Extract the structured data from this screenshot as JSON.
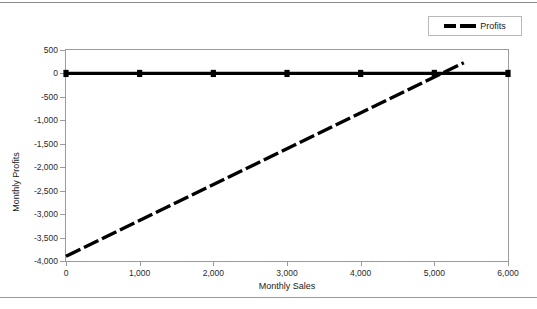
{
  "legend": {
    "position": "top-right",
    "entries": [
      {
        "label": "Profits",
        "style": "dashed",
        "color": "#000000"
      }
    ]
  },
  "chart_data": {
    "type": "line",
    "title": "",
    "xlabel": "Monthly Sales",
    "ylabel": "Monthly Profits",
    "xlim": [
      0,
      6000
    ],
    "ylim": [
      -4000,
      500
    ],
    "xticks": [
      "0",
      "1,000",
      "2,000",
      "3,000",
      "4,000",
      "5,000",
      "6,000"
    ],
    "xtick_values": [
      0,
      1000,
      2000,
      3000,
      4000,
      5000,
      6000
    ],
    "yticks": [
      "500",
      "0",
      "-500",
      "-1,000",
      "-1,500",
      "-2,000",
      "-2,500",
      "-3,000",
      "-3,500",
      "-4,000"
    ],
    "ytick_values": [
      500,
      0,
      -500,
      -1000,
      -1500,
      -2000,
      -2500,
      -3000,
      -3500,
      -4000
    ],
    "grid": false,
    "series": [
      {
        "name": "Zero Line",
        "style": "solid",
        "color": "#000000",
        "marker": "square",
        "x": [
          0,
          1000,
          2000,
          3000,
          4000,
          5000,
          6000
        ],
        "values": [
          0,
          0,
          0,
          0,
          0,
          0,
          0
        ]
      },
      {
        "name": "Profits",
        "style": "dashed",
        "color": "#000000",
        "marker": "none",
        "x": [
          0,
          5400
        ],
        "values": [
          -3900,
          230
        ]
      }
    ],
    "breakeven_x": 5200
  }
}
